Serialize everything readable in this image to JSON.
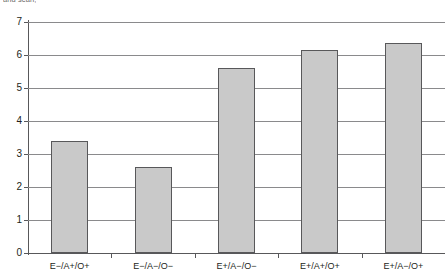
{
  "caption": {
    "clipped_text": "and scan,"
  },
  "chart_data": {
    "type": "bar",
    "title": "",
    "xlabel": "",
    "ylabel": "",
    "categories": [
      "E−/A+/O+",
      "E−/A−/O−",
      "E+/A−/O−",
      "E+/A+/O+",
      "E+/A−/O+"
    ],
    "values": [
      3.4,
      2.6,
      5.6,
      6.15,
      6.35
    ],
    "ylim": [
      0,
      7
    ],
    "yticks": [
      0,
      1,
      2,
      3,
      4,
      5,
      6,
      7
    ],
    "ytick_labels": [
      "0",
      "1",
      "2",
      "3",
      "4",
      "5",
      "6",
      "7"
    ],
    "grid": true,
    "legend": false,
    "bar_color": "#c9c9c9",
    "bar_edge_color": "#58585a",
    "axis_color": "#58585a",
    "grid_color": "#8a8a8c"
  }
}
